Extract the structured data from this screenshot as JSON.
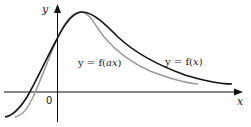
{
  "figure": {
    "axes": {
      "x_label": "x",
      "y_label": "y",
      "origin_label": "0"
    },
    "curves": [
      {
        "name": "f(x)",
        "label_prefix": "y = f(",
        "label_arg": "x",
        "label_suffix": ")",
        "color": "#111111",
        "description": "original curve, wider"
      },
      {
        "name": "f(ax)",
        "label_prefix": "y = f(",
        "label_arg": "ax",
        "label_suffix": ")",
        "color": "#9a9a9a",
        "description": "horizontally compressed curve (a > 1), same y-intercept and peak height"
      }
    ],
    "colors": {
      "axis": "#111111",
      "curve_fx": "#111111",
      "curve_fax": "#9a9a9a",
      "background": "#ffffff"
    }
  }
}
